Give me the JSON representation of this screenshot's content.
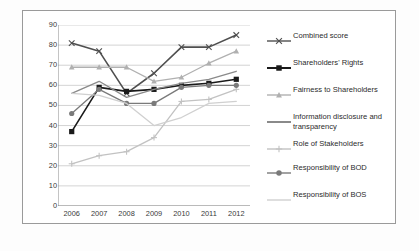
{
  "chart_data": {
    "type": "line",
    "title": "",
    "xlabel": "",
    "ylabel": "",
    "x": [
      "2006",
      "2007",
      "2008",
      "2009",
      "2010",
      "2011",
      "2012"
    ],
    "categories": [
      "2006",
      "2007",
      "2008",
      "2009",
      "2010",
      "2011",
      "2012"
    ],
    "ylim": [
      0,
      90
    ],
    "yticks": [
      0,
      10,
      20,
      30,
      40,
      50,
      60,
      70,
      80,
      90
    ],
    "ytick_labels": [
      "0",
      "10",
      "20",
      "30",
      "40",
      "50",
      "60",
      "70",
      "80",
      "90"
    ],
    "grid": true,
    "grid_axis": "y",
    "legend_position": "right",
    "series": [
      {
        "name": "Combined score",
        "color": "#4f4f4f",
        "marker": "x",
        "values": [
          81,
          77,
          56,
          66,
          79,
          79,
          85
        ]
      },
      {
        "name": "Shareholders' Rights",
        "color": "#1a1a1a",
        "marker": "square",
        "values": [
          37,
          59,
          57,
          58,
          60,
          61,
          63
        ]
      },
      {
        "name": "Fairness to Shareholders",
        "color": "#b0b0b0",
        "marker": "triangle",
        "values": [
          69,
          69,
          69,
          62,
          64,
          71,
          77
        ]
      },
      {
        "name": "Information disclosure and transparency",
        "color": "#8a8a8a",
        "marker": "none",
        "values": [
          56,
          62,
          54,
          58,
          61,
          63,
          67
        ]
      },
      {
        "name": "Role of Stakeholders",
        "color": "#c2c2c2",
        "marker": "plus",
        "values": [
          21,
          25,
          27,
          34,
          52,
          53,
          58
        ]
      },
      {
        "name": "Responsibility of BOD",
        "color": "#7a7a7a",
        "marker": "circle",
        "values": [
          46,
          58,
          51,
          51,
          59,
          60,
          60
        ]
      },
      {
        "name": "Responsibility of BOS",
        "color": "#d0d0d0",
        "marker": "none",
        "values": [
          56,
          55,
          51,
          40,
          44,
          51,
          52
        ]
      }
    ]
  },
  "legend": {
    "items": [
      {
        "label": "Combined score"
      },
      {
        "label": "Shareholders' Rights"
      },
      {
        "label": "Fairness to Shareholders"
      },
      {
        "label": "Information disclosure and transparency"
      },
      {
        "label": "Role of Stakeholders"
      },
      {
        "label": "Responsibility of BOD"
      },
      {
        "label": "Responsibility of BOS"
      }
    ]
  }
}
